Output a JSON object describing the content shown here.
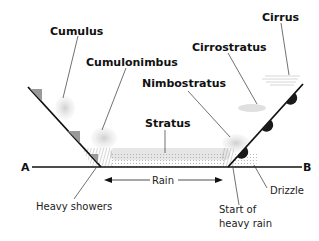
{
  "diagram": {
    "cloud_labels": [
      {
        "id": "cumulus",
        "text": "Cumulus"
      },
      {
        "id": "cumulonimbus",
        "text": "Cumulonimbus"
      },
      {
        "id": "nimbostratus",
        "text": "Nimbostratus"
      },
      {
        "id": "stratus",
        "text": "Stratus"
      },
      {
        "id": "cirrostratus",
        "text": "Cirrostratus"
      },
      {
        "id": "cirrus",
        "text": "Cirrus"
      }
    ],
    "point_labels": {
      "a": "A",
      "b": "B"
    },
    "precip_labels": {
      "heavy_showers": "Heavy showers",
      "rain": "Rain",
      "start_heavy_rain_line1": "Start of",
      "start_heavy_rain_line2": "heavy rain",
      "drizzle": "Drizzle"
    },
    "colors": {
      "line": "#111111",
      "cloud": "#d9d9d9",
      "cold_front_triangle": "#9a9a9a",
      "warm_front_semicircle": "#1a1a1a",
      "hatch": "#999999"
    }
  }
}
